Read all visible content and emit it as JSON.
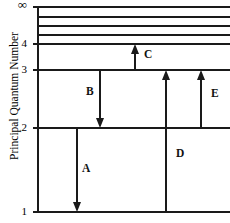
{
  "diagram": {
    "title_axis_y": "Principal Quantum Number",
    "type": "energy-level-transition-diagram",
    "plot": {
      "left": 38,
      "right": 230,
      "top": 7,
      "bottom": 212
    },
    "levels": [
      {
        "n": "∞",
        "label": "∞",
        "y": 7,
        "tick": true,
        "x_end": 230
      },
      {
        "n": "",
        "label": "",
        "y": 17,
        "tick": false,
        "x_end": 230
      },
      {
        "n": "",
        "label": "",
        "y": 26,
        "tick": false,
        "x_end": 230
      },
      {
        "n": "",
        "label": "",
        "y": 35,
        "tick": false,
        "x_end": 230
      },
      {
        "n": "4",
        "label": "4",
        "y": 44,
        "tick": true,
        "x_end": 230
      },
      {
        "n": "3",
        "label": "3",
        "y": 70,
        "tick": true,
        "x_end": 230
      },
      {
        "n": "2",
        "label": "2",
        "y": 128,
        "tick": true,
        "x_end": 230
      },
      {
        "n": "1",
        "label": "1",
        "y": 212,
        "tick": true,
        "x_end": 230
      }
    ],
    "transitions": [
      {
        "id": "A",
        "label": "A",
        "x": 77,
        "y_start": 128,
        "y_end": 212,
        "direction": "down",
        "from_level": "2",
        "to_level": "1",
        "label_x": 82,
        "label_y": 163
      },
      {
        "id": "B",
        "label": "B",
        "x": 100,
        "y_start": 70,
        "y_end": 128,
        "direction": "down",
        "from_level": "3",
        "to_level": "2",
        "label_x": 86,
        "label_y": 86
      },
      {
        "id": "C",
        "label": "C",
        "x": 135,
        "y_start": 70,
        "y_end": 44,
        "direction": "up",
        "from_level": "3",
        "to_level": "4",
        "label_x": 144,
        "label_y": 49
      },
      {
        "id": "D",
        "label": "D",
        "x": 166,
        "y_start": 212,
        "y_end": 70,
        "direction": "up",
        "from_level": "1",
        "to_level": "3",
        "label_x": 176,
        "label_y": 148
      },
      {
        "id": "E",
        "label": "E",
        "x": 201,
        "y_start": 128,
        "y_end": 70,
        "direction": "up",
        "from_level": "2",
        "to_level": "3",
        "label_x": 211,
        "label_y": 88
      }
    ],
    "colors": {
      "line": "#1a1a1a",
      "text": "#000000",
      "background": "#ffffff"
    }
  }
}
